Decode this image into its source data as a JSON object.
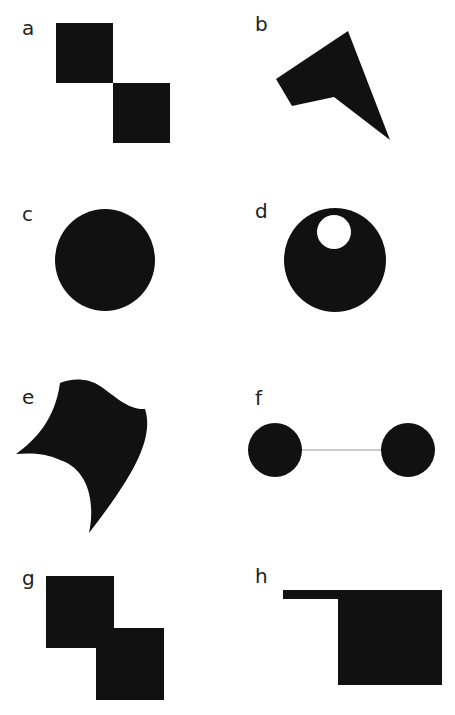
{
  "figure": {
    "fill_color": "#111111",
    "background_color": "#ffffff",
    "connector_color": "#bbbbbb",
    "panels": [
      {
        "label": "a",
        "description": "two squares touching at a corner, diagonal arrangement"
      },
      {
        "label": "b",
        "description": "irregular concave pentagon / arrowhead shape"
      },
      {
        "label": "c",
        "description": "solid circle"
      },
      {
        "label": "d",
        "description": "solid circle with small circular hole near top"
      },
      {
        "label": "e",
        "description": "curved-edge concave shape"
      },
      {
        "label": "f",
        "description": "two solid circles connected by a thin line"
      },
      {
        "label": "g",
        "description": "two overlapping squares, diagonal arrangement"
      },
      {
        "label": "h",
        "description": "rectangle with thin bar extending to the left from top edge"
      }
    ]
  }
}
